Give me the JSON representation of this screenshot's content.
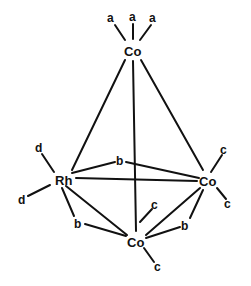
{
  "atoms": {
    "co_top": "Co",
    "rh": "Rh",
    "co_right": "Co",
    "co_bottom": "Co"
  },
  "ligands": {
    "a1": "a",
    "a2": "a",
    "a3": "a",
    "d1": "d",
    "d2": "d",
    "c_right_1": "c",
    "c_right_2": "c",
    "c_bottom_1": "c",
    "c_bottom_2": "c",
    "b_top": "b",
    "b_left": "b",
    "b_right": "b"
  }
}
